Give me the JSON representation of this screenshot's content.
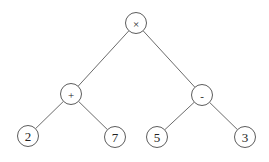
{
  "diagram": {
    "type": "expression-tree",
    "expression": "(2 + 7) × (5 - 3)",
    "node_radius": 10.5,
    "colors": {
      "background": "#ffffff",
      "edge": "#5a5a5a",
      "node_stroke": "#4a4a4a",
      "label": "#222222"
    },
    "nodes": [
      {
        "id": "root",
        "label": "×",
        "kind": "operator",
        "x": 136,
        "y": 23
      },
      {
        "id": "plus",
        "label": "+",
        "kind": "operator",
        "x": 71,
        "y": 94
      },
      {
        "id": "minus",
        "label": "-",
        "kind": "operator",
        "x": 202,
        "y": 95
      },
      {
        "id": "n2",
        "label": "2",
        "kind": "operand",
        "x": 28,
        "y": 136
      },
      {
        "id": "n7",
        "label": "7",
        "kind": "operand",
        "x": 115,
        "y": 137
      },
      {
        "id": "n5",
        "label": "5",
        "kind": "operand",
        "x": 157,
        "y": 137
      },
      {
        "id": "n3",
        "label": "3",
        "kind": "operand",
        "x": 245,
        "y": 137
      }
    ],
    "edges": [
      {
        "from": "root",
        "to": "plus"
      },
      {
        "from": "root",
        "to": "minus"
      },
      {
        "from": "plus",
        "to": "n2"
      },
      {
        "from": "plus",
        "to": "n7"
      },
      {
        "from": "minus",
        "to": "n5"
      },
      {
        "from": "minus",
        "to": "n3"
      }
    ]
  }
}
